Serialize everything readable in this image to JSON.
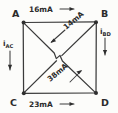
{
  "figure": {
    "type": "circuit-network-diagram",
    "background_color": "#fcfcfa",
    "ink_color": "#2e2e2e"
  },
  "nodes": [
    {
      "id": "A",
      "label": "A",
      "position": "top-left"
    },
    {
      "id": "B",
      "label": "B",
      "position": "top-right"
    },
    {
      "id": "C",
      "label": "C",
      "position": "bottom-left"
    },
    {
      "id": "D",
      "label": "D",
      "position": "bottom-right"
    }
  ],
  "branches": [
    {
      "id": "AB",
      "label": "16mA",
      "edge": "top",
      "arrow_direction": "right",
      "value": 16,
      "unit": "mA"
    },
    {
      "id": "CD",
      "label": "23mA",
      "edge": "bottom",
      "arrow_direction": "right",
      "value": 23,
      "unit": "mA"
    },
    {
      "id": "AC",
      "label": "i",
      "subscript": "AC",
      "edge": "left",
      "arrow_direction": "down",
      "value": null,
      "unit": ""
    },
    {
      "id": "BD",
      "label": "i",
      "subscript": "BD",
      "edge": "right",
      "arrow_direction": "down",
      "value": null,
      "unit": ""
    },
    {
      "id": "BC",
      "label": "14mA",
      "edge": "diagonal-upper",
      "arrow_direction": "down-left",
      "value": 14,
      "unit": "mA"
    },
    {
      "id": "AD",
      "label": "38mA",
      "edge": "diagonal-lower",
      "arrow_direction": "up-right",
      "value": 38,
      "unit": "mA"
    }
  ]
}
